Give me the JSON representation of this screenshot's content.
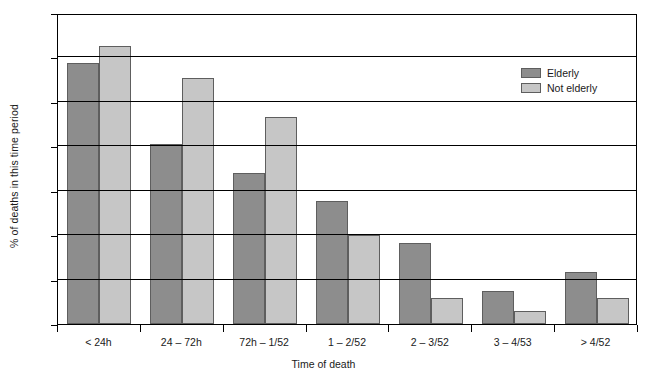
{
  "chart_data": {
    "type": "bar",
    "title": "",
    "xlabel": "Time of death",
    "ylabel": "% of deaths in this time period",
    "categories": [
      "< 24h",
      "24 – 72h",
      "72h – 1/52",
      "1 – 2/52",
      "2 – 3/52",
      "3 – 4/53",
      "> 4/52"
    ],
    "series": [
      {
        "name": "Elderly",
        "color": "#8d8d8d",
        "values": [
          29.4,
          20.3,
          17.0,
          13.9,
          9.1,
          3.7,
          5.9
        ]
      },
      {
        "name": "Not elderly",
        "color": "#c6c6c6",
        "values": [
          31.3,
          27.7,
          23.3,
          10.0,
          2.9,
          1.5,
          2.9
        ]
      }
    ],
    "ylim": [
      0,
      35
    ],
    "yticks": [
      0,
      5,
      10,
      15,
      20,
      25,
      30,
      35
    ],
    "ytick_labels": [
      "0%",
      "5%",
      "10%",
      "15%",
      "20%",
      "25%",
      "30%",
      "35%"
    ],
    "grid": true,
    "legend_position": "top-right"
  },
  "legend": {
    "entries": [
      {
        "label": "Elderly"
      },
      {
        "label": "Not elderly"
      }
    ]
  }
}
